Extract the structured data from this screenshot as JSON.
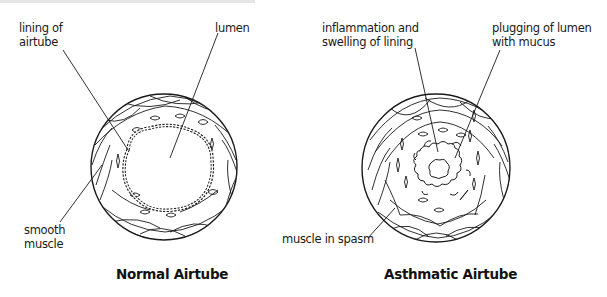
{
  "diagram": {
    "type": "anatomical-comparison",
    "panels": [
      {
        "id": "normal",
        "title": "Normal Airtube",
        "labels": [
          {
            "text": "lining of\nairtube",
            "target": "airtube lining (outer wall)"
          },
          {
            "text": "lumen",
            "target": "open central lumen"
          },
          {
            "text": "smooth\nmuscle",
            "target": "smooth muscle layer"
          }
        ]
      },
      {
        "id": "asthmatic",
        "title": "Asthmatic Airtube",
        "labels": [
          {
            "text": "inflammation and\nswelling of lining",
            "target": "swollen inflamed lining"
          },
          {
            "text": "plugging of lumen\nwith mucus",
            "target": "mucus plug in narrowed lumen"
          },
          {
            "text": "muscle in spasm",
            "target": "contracted smooth muscle"
          }
        ]
      }
    ]
  },
  "colors": {
    "ink": "#1a1a1a",
    "background": "#ffffff"
  }
}
